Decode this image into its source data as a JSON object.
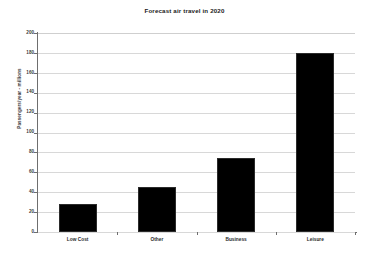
{
  "chart_data": {
    "type": "bar",
    "title": "Forecast air travel in 2020",
    "xlabel": "",
    "ylabel": "Passengers/year - millions",
    "categories": [
      "Low Cost",
      "Other",
      "Business",
      "Leisure"
    ],
    "values": [
      28,
      45,
      74,
      180
    ],
    "ylim": [
      0,
      200
    ],
    "ytick_values": [
      0,
      20,
      40,
      60,
      80,
      100,
      120,
      140,
      160,
      180,
      200
    ],
    "ytick_labels": [
      "0",
      "20",
      "40",
      "60",
      "80",
      "100",
      "120",
      "140",
      "160",
      "180",
      "200"
    ],
    "grid": "horizontal",
    "legend": "none",
    "series": [
      {
        "name": "Forecast passengers",
        "values": [
          28,
          45,
          74,
          180
        ]
      }
    ],
    "colors": {
      "bar": "#000000",
      "bar_outline": "#2b2b2b",
      "gridline": "#d8d8d8",
      "axis": "#6e6e6e",
      "text": "#1a1a1a",
      "background": "#ffffff"
    }
  }
}
